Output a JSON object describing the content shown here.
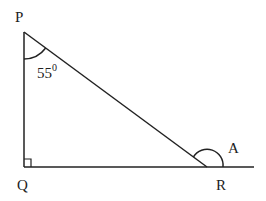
{
  "diagram": {
    "type": "triangle",
    "vertices": {
      "P": "P",
      "Q": "Q",
      "R": "R"
    },
    "angle_P": {
      "value": "55",
      "unit": "0"
    },
    "exterior_angle_label": "A",
    "right_angle_at": "Q",
    "stroke_color": "#222222"
  }
}
